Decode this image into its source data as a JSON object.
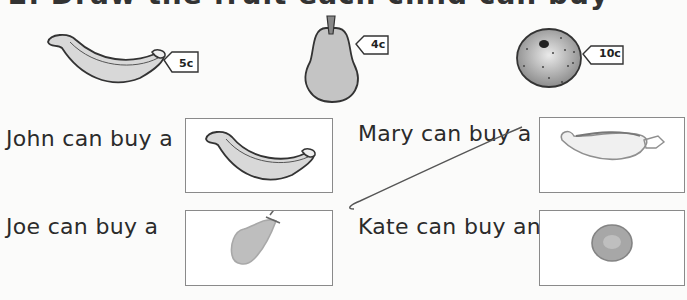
{
  "worksheet": {
    "heading": "2. Draw the fruit each child can buy",
    "items": [
      {
        "fruit": "banana",
        "price": "5c"
      },
      {
        "fruit": "pear",
        "price": "4c"
      },
      {
        "fruit": "orange",
        "price": "10c"
      }
    ],
    "questions": [
      {
        "text": "John can buy a",
        "answer": "banana (printed)"
      },
      {
        "text": "Mary can buy a",
        "answer": "banana (pencil drawing)"
      },
      {
        "text": "Joe can buy a",
        "answer": "pear (pencil drawing)"
      },
      {
        "text": "Kate can buy an",
        "answer": "orange (pencil drawing)"
      }
    ]
  },
  "colors": {
    "fruit_fill": "#c9c9c9",
    "outline": "#333333",
    "box_border": "#8a8a8a"
  }
}
